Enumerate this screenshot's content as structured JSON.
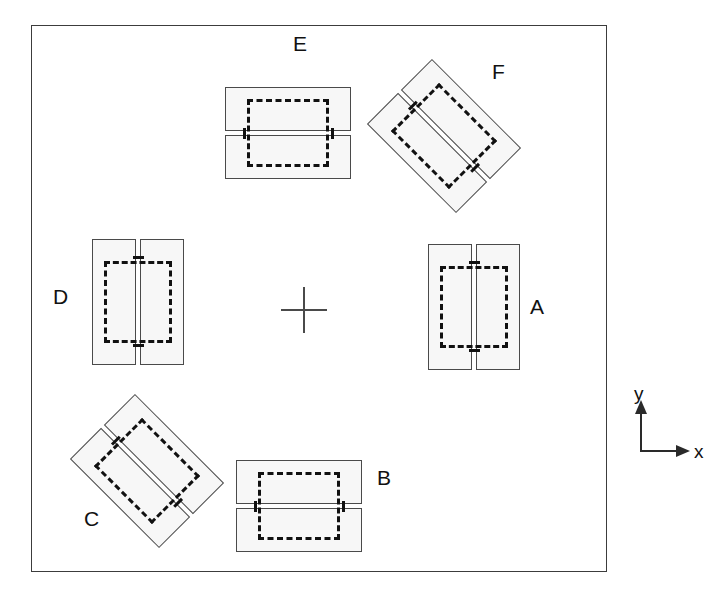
{
  "diagram": {
    "frame": {
      "x": 31,
      "y": 25,
      "width": 576,
      "height": 547,
      "border_color": "#3c3c3c"
    },
    "center_marker": {
      "name": "crosshair",
      "x": 281,
      "y": 287,
      "size": 46
    },
    "style": {
      "plate_fill": "#f7f7f7",
      "plate_stroke": "#4a4a4a",
      "dashed_stroke": "#111111",
      "label_color": "#111111"
    },
    "specimens": [
      {
        "label": "A",
        "x": 428,
        "y": 244,
        "rotation": 0,
        "orientation": "vertical",
        "label_x": 530,
        "label_y": 296
      },
      {
        "label": "B",
        "x": 253,
        "y": 443,
        "rotation": 90,
        "orientation": "horizontal",
        "label_x": 377,
        "label_y": 467
      },
      {
        "label": "C",
        "x": 101,
        "y": 408,
        "rotation": 135,
        "orientation": "diagonal",
        "label_x": 84,
        "label_y": 508
      },
      {
        "label": "D",
        "x": 92,
        "y": 239,
        "rotation": 0,
        "orientation": "vertical",
        "label_x": 53,
        "label_y": 286
      },
      {
        "label": "E",
        "x": 242,
        "y": 70,
        "rotation": 90,
        "orientation": "horizontal",
        "label_x": 293,
        "label_y": 33
      },
      {
        "label": "F",
        "x": 398,
        "y": 73,
        "rotation": 135,
        "orientation": "diagonal",
        "label_x": 492,
        "label_y": 61
      }
    ],
    "axis_legend": {
      "x": 632,
      "y": 398,
      "y_label": "y",
      "x_label": "x"
    }
  }
}
